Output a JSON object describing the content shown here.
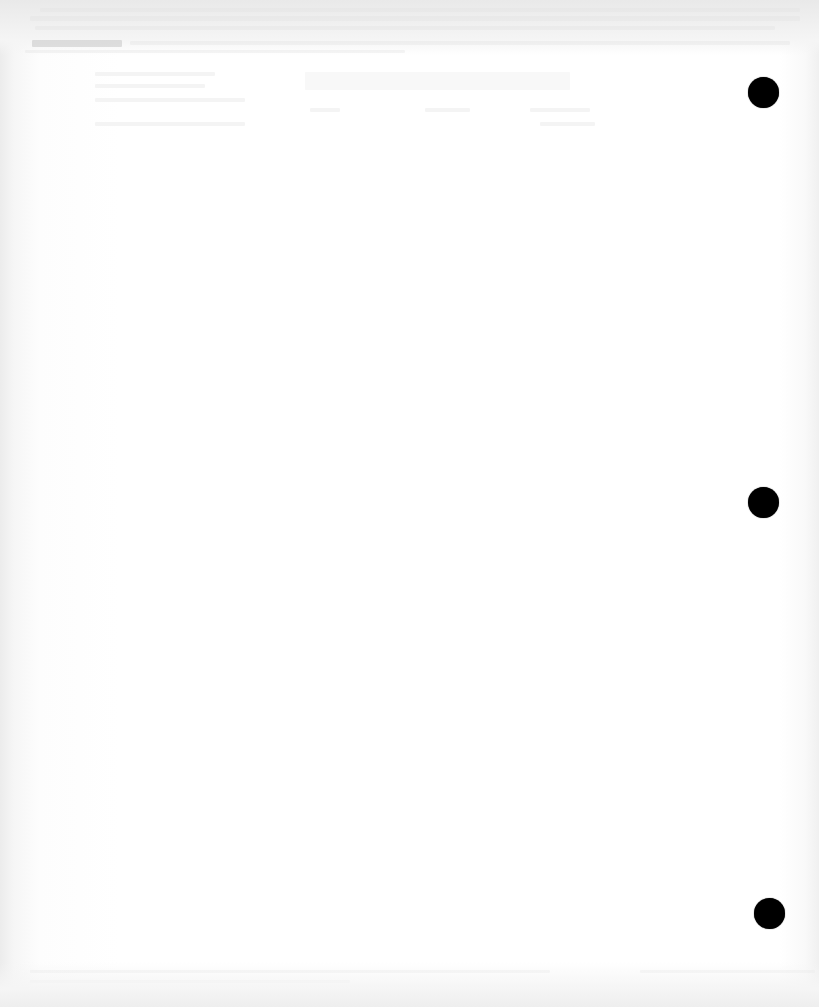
{
  "document": {
    "type": "scanned blank page",
    "background_color": "#ffffff",
    "hole_punch_color": "#000000",
    "hole_punches": [
      {
        "x": 763,
        "y": 92
      },
      {
        "x": 763,
        "y": 502
      },
      {
        "x": 769,
        "y": 913
      }
    ]
  }
}
